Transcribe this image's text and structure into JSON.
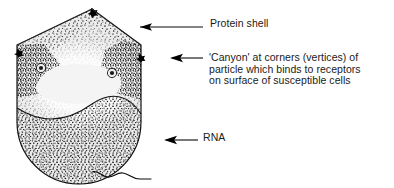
{
  "figure": {
    "background_color": "#ffffff",
    "ink_color": "#000000",
    "interior_fill": "#e8e8e8",
    "core_fill": "#f2f2f2",
    "labels": [
      {
        "id": "protein-shell",
        "text": "Protein shell",
        "lines": [
          "Protein shell"
        ],
        "arrow_from": [
          203,
          27
        ],
        "arrow_to": [
          130,
          27
        ]
      },
      {
        "id": "canyon",
        "text": "'Canyon' at corners (vertices) of particle which binds to receptors on surface of susceptible cells",
        "lines": [
          "'Canyon' at corners (vertices) of",
          "particle which binds to receptors",
          "on surface of susceptible cells"
        ],
        "arrow_from": [
          203,
          58
        ],
        "arrow_to": [
          163,
          58
        ]
      },
      {
        "id": "rna",
        "text": "RNA",
        "lines": [
          "RNA"
        ],
        "arrow_from": [
          198,
          140
        ],
        "arrow_to": [
          155,
          140
        ]
      }
    ],
    "particle": {
      "name": "virus-particle",
      "shell_type": "icosahedral-protein-shell",
      "features": [
        "stippled protein shell",
        "canyon depressions at vertices",
        "light interior core",
        "densely stippled RNA region",
        "RNA strand tail"
      ],
      "vertex_markers": 3,
      "canyon_pits": 2,
      "tail": "wavy-rna-strand"
    }
  }
}
